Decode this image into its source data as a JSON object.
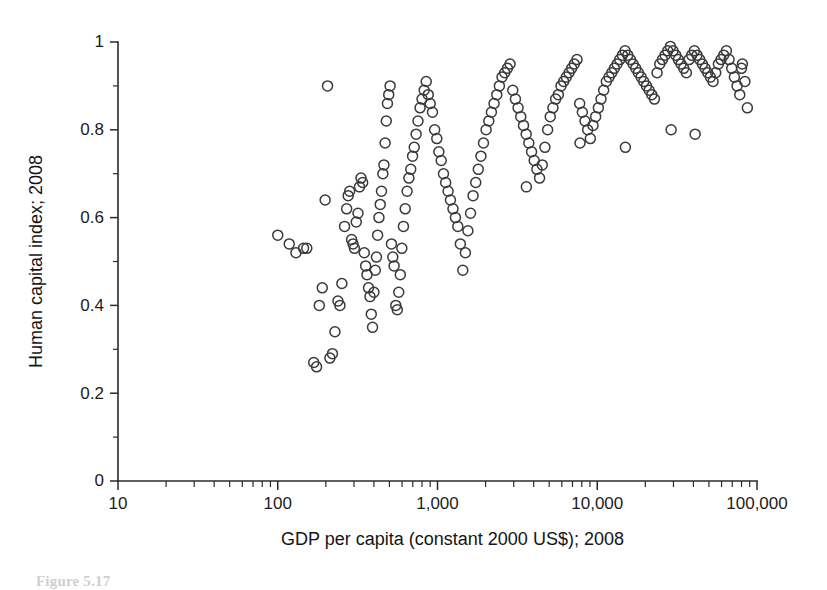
{
  "figure": {
    "caption": "Figure 5.17",
    "background_color": "#ffffff",
    "marker_color": "#3a3a3a",
    "axis_color": "#2b2b2b"
  },
  "chart_data": {
    "type": "scatter",
    "title": "",
    "subtitle": "",
    "xlabel": "GDP per capita (constant 2000 US$); 2008",
    "ylabel": "Human capital index; 2008",
    "xscale": "log",
    "yscale": "linear",
    "xlim": [
      10,
      100000
    ],
    "ylim": [
      0,
      1
    ],
    "grid": false,
    "legend": null,
    "xticks": [
      10,
      100,
      1000,
      10000,
      100000
    ],
    "xtick_labels": [
      "10",
      "100",
      "1,000",
      "10,000",
      "100,000"
    ],
    "yticks": [
      0,
      0.2,
      0.4,
      0.6,
      0.8,
      1
    ],
    "ytick_labels": [
      "0",
      "0.2",
      "0.4",
      "0.6",
      "0.8",
      "1"
    ],
    "yminor_ticks": [
      0.1,
      0.3,
      0.5,
      0.7,
      0.9
    ],
    "marker": "open-circle",
    "marker_size": 10,
    "series": [
      {
        "name": "countries",
        "x": [
          100,
          118,
          130,
          145,
          152,
          168,
          175,
          182,
          190,
          198,
          205,
          212,
          220,
          228,
          238,
          245,
          252,
          262,
          270,
          276,
          282,
          290,
          296,
          302,
          310,
          318,
          325,
          332,
          340,
          348,
          355,
          362,
          370,
          378,
          385,
          392,
          400,
          408,
          415,
          422,
          430,
          438,
          446,
          455,
          462,
          470,
          478,
          486,
          495,
          505,
          515,
          525,
          535,
          548,
          560,
          572,
          585,
          598,
          612,
          628,
          645,
          662,
          680,
          698,
          715,
          735,
          755,
          778,
          800,
          825,
          850,
          875,
          900,
          930,
          960,
          990,
          1020,
          1055,
          1090,
          1125,
          1165,
          1205,
          1250,
          1295,
          1340,
          1390,
          1440,
          1495,
          1550,
          1610,
          1670,
          1735,
          1800,
          1870,
          1940,
          2015,
          2095,
          2175,
          2260,
          2350,
          2440,
          2535,
          2635,
          2740,
          2845,
          2960,
          3075,
          3195,
          3320,
          3455,
          3590,
          3730,
          3880,
          4030,
          4190,
          4355,
          4525,
          4705,
          4890,
          5080,
          5280,
          5490,
          5705,
          5930,
          6160,
          6400,
          6655,
          6915,
          7185,
          7465,
          7760,
          8065,
          8380,
          8710,
          9050,
          9405,
          9775,
          10160,
          10560,
          10970,
          11400,
          11850,
          12320,
          12800,
          13310,
          13830,
          14370,
          14930,
          15520,
          16130,
          16760,
          17420,
          18100,
          18820,
          19550,
          20320,
          21110,
          21940,
          22800,
          23690,
          24620,
          25580,
          26580,
          27620,
          28700,
          29820,
          30990,
          32200,
          33460,
          34770,
          36130,
          37550,
          39020,
          40550,
          42140,
          43790,
          45510,
          47300,
          49150,
          51080,
          53080,
          55160,
          57320,
          59570,
          61900,
          64330,
          66850,
          69470,
          72190,
          75020,
          78000,
          81000,
          84000,
          87000,
          80000,
          41000,
          29000,
          15000,
          7800,
          3600
        ],
        "y": [
          0.56,
          0.54,
          0.52,
          0.53,
          0.53,
          0.27,
          0.26,
          0.4,
          0.44,
          0.64,
          0.9,
          0.28,
          0.29,
          0.34,
          0.41,
          0.4,
          0.45,
          0.58,
          0.62,
          0.65,
          0.66,
          0.55,
          0.54,
          0.53,
          0.59,
          0.61,
          0.67,
          0.69,
          0.68,
          0.52,
          0.49,
          0.47,
          0.44,
          0.42,
          0.38,
          0.35,
          0.43,
          0.48,
          0.51,
          0.56,
          0.6,
          0.63,
          0.66,
          0.7,
          0.72,
          0.77,
          0.82,
          0.86,
          0.88,
          0.9,
          0.54,
          0.51,
          0.49,
          0.4,
          0.39,
          0.43,
          0.47,
          0.53,
          0.58,
          0.62,
          0.66,
          0.69,
          0.71,
          0.74,
          0.76,
          0.79,
          0.82,
          0.85,
          0.87,
          0.89,
          0.91,
          0.88,
          0.86,
          0.84,
          0.8,
          0.78,
          0.75,
          0.73,
          0.7,
          0.68,
          0.66,
          0.64,
          0.62,
          0.6,
          0.58,
          0.54,
          0.48,
          0.52,
          0.57,
          0.61,
          0.65,
          0.68,
          0.71,
          0.74,
          0.77,
          0.8,
          0.82,
          0.84,
          0.86,
          0.88,
          0.9,
          0.92,
          0.93,
          0.94,
          0.95,
          0.89,
          0.87,
          0.85,
          0.83,
          0.81,
          0.79,
          0.77,
          0.75,
          0.73,
          0.71,
          0.69,
          0.72,
          0.76,
          0.8,
          0.83,
          0.85,
          0.87,
          0.88,
          0.9,
          0.91,
          0.92,
          0.93,
          0.94,
          0.95,
          0.96,
          0.86,
          0.84,
          0.82,
          0.8,
          0.78,
          0.81,
          0.83,
          0.85,
          0.87,
          0.89,
          0.91,
          0.92,
          0.93,
          0.94,
          0.95,
          0.96,
          0.97,
          0.98,
          0.97,
          0.96,
          0.95,
          0.94,
          0.93,
          0.92,
          0.91,
          0.9,
          0.89,
          0.88,
          0.87,
          0.93,
          0.95,
          0.96,
          0.97,
          0.98,
          0.99,
          0.98,
          0.97,
          0.96,
          0.95,
          0.94,
          0.93,
          0.96,
          0.97,
          0.98,
          0.97,
          0.96,
          0.95,
          0.94,
          0.93,
          0.92,
          0.91,
          0.93,
          0.95,
          0.96,
          0.97,
          0.98,
          0.96,
          0.94,
          0.92,
          0.9,
          0.88,
          0.95,
          0.91,
          0.85,
          0.94,
          0.79,
          0.8,
          0.76,
          0.77,
          0.67
        ]
      }
    ]
  }
}
